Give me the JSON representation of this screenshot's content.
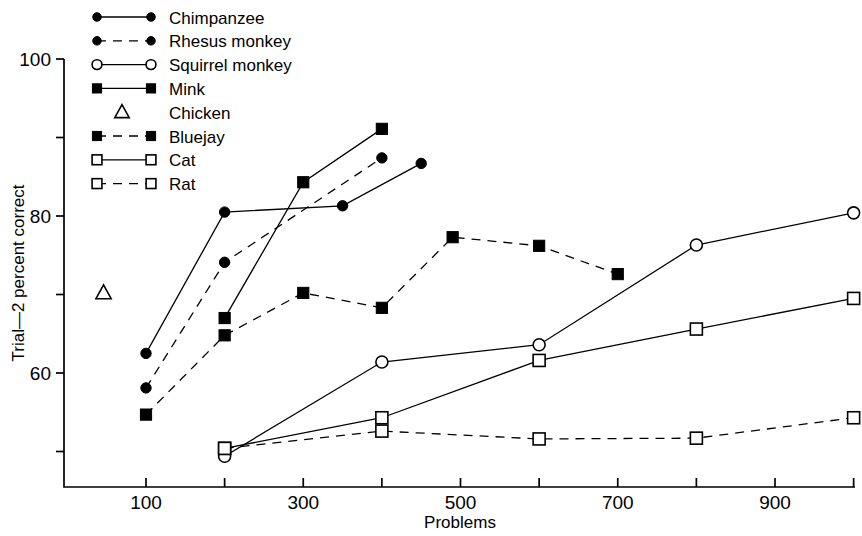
{
  "chart_data": {
    "type": "line",
    "title": "",
    "xlabel": "Problems",
    "ylabel": "Trial—2 percent correct",
    "xlim": [
      0,
      1040
    ],
    "ylim": [
      46,
      100
    ],
    "grid": false,
    "legend_position": "top-left",
    "x_ticks_major": [
      100,
      300,
      500,
      700,
      900
    ],
    "x_ticks_minor": [
      200,
      400,
      600,
      800,
      1000
    ],
    "x_tick_labels": [
      "100",
      "300",
      "500",
      "700",
      "900"
    ],
    "y_ticks_major": [
      60,
      80,
      100
    ],
    "y_ticks_minor": [
      50,
      70,
      90
    ],
    "y_tick_labels": [
      "60",
      "80",
      "100"
    ],
    "series": [
      {
        "name": "Chimpanzee",
        "marker": "filled-circle",
        "line": "solid",
        "x": [
          100,
          200,
          350,
          450
        ],
        "values": [
          62.5,
          80.5,
          81.3,
          86.7
        ]
      },
      {
        "name": "Rhesus monkey",
        "marker": "filled-circle",
        "line": "dashed",
        "x": [
          100,
          200,
          400
        ],
        "values": [
          58.1,
          74.1,
          87.4
        ]
      },
      {
        "name": "Squirrel monkey",
        "marker": "open-circle",
        "line": "solid",
        "x": [
          200,
          400,
          600,
          800,
          1000
        ],
        "values": [
          49.4,
          61.4,
          63.6,
          76.3,
          80.4
        ]
      },
      {
        "name": "Mink",
        "marker": "filled-square",
        "line": "solid",
        "x": [
          200,
          300,
          400
        ],
        "values": [
          67.0,
          84.3,
          91.1
        ]
      },
      {
        "name": "Chicken",
        "marker": "open-triangle",
        "line": "none",
        "x": [
          46
        ],
        "values": [
          70.2
        ]
      },
      {
        "name": "Bluejay",
        "marker": "filled-square",
        "line": "dashed",
        "x": [
          100,
          200,
          300,
          400,
          490,
          600,
          700
        ],
        "values": [
          54.7,
          64.8,
          70.2,
          68.3,
          77.3,
          76.2,
          72.6
        ]
      },
      {
        "name": "Cat",
        "marker": "open-square",
        "line": "solid",
        "x": [
          200,
          400,
          600,
          800,
          1000
        ],
        "values": [
          50.4,
          54.3,
          61.6,
          65.6,
          69.5
        ]
      },
      {
        "name": "Rat",
        "marker": "open-square",
        "line": "dashed",
        "x": [
          200,
          400,
          600,
          800,
          1000
        ],
        "values": [
          50.4,
          52.6,
          51.6,
          51.7,
          54.3
        ]
      }
    ]
  },
  "legend": {
    "entries": [
      {
        "label": "Chimpanzee",
        "marker": "filled-circle",
        "line": "solid"
      },
      {
        "label": "Rhesus monkey",
        "marker": "filled-circle",
        "line": "dashed"
      },
      {
        "label": "Squirrel monkey",
        "marker": "open-circle",
        "line": "solid"
      },
      {
        "label": "Mink",
        "marker": "filled-square",
        "line": "solid"
      },
      {
        "label": "Chicken",
        "marker": "open-triangle",
        "line": "none"
      },
      {
        "label": "Bluejay",
        "marker": "filled-square",
        "line": "dashed"
      },
      {
        "label": "Cat",
        "marker": "open-square",
        "line": "solid"
      },
      {
        "label": "Rat",
        "marker": "open-square",
        "line": "dashed"
      }
    ]
  },
  "colors": {
    "ink": "#000000",
    "background": "#ffffff"
  }
}
